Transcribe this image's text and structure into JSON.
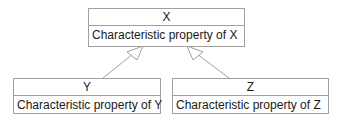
{
  "diagram": {
    "type": "uml-class-inheritance",
    "classes": [
      {
        "id": "X",
        "name": "X",
        "property": "Characteristic property of X"
      },
      {
        "id": "Y",
        "name": "Y",
        "property": "Characteristic property of Y"
      },
      {
        "id": "Z",
        "name": "Z",
        "property": "Characteristic property of Z"
      }
    ],
    "edges": [
      {
        "from": "Y",
        "to": "X",
        "kind": "generalization"
      },
      {
        "from": "Z",
        "to": "X",
        "kind": "generalization"
      }
    ],
    "colors": {
      "border": "#a0a0a0",
      "arrow": "#a0a0a0",
      "text": "#1a1a1a"
    }
  }
}
